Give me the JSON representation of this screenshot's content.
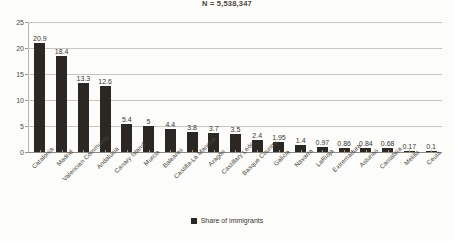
{
  "chart_data": {
    "type": "bar",
    "title": "N = 5,538,347",
    "xlabel": "",
    "ylabel": "",
    "ylim": [
      0,
      25
    ],
    "yticks": [
      0,
      5,
      10,
      15,
      20,
      25
    ],
    "grid": true,
    "legend_position": "bottom",
    "series_name": "Share of immigrants",
    "bar_color": "#2b2722",
    "categories": [
      "Catalonia",
      "Madrid",
      "Valencian Community",
      "Andalucia",
      "Canary Island",
      "Murcia",
      "Baleares",
      "Castilla-La Mancha",
      "Aragón",
      "Castillary León",
      "Basque Country",
      "Galicia",
      "Navarra",
      "LaRioja",
      "Extremadura",
      "Asturias",
      "Cantabria",
      "Melilla",
      "Ceuta"
    ],
    "values": [
      20.9,
      18.4,
      13.3,
      12.6,
      5.4,
      5,
      4.4,
      3.8,
      3.7,
      3.5,
      2.4,
      1.95,
      1.4,
      0.97,
      0.86,
      0.84,
      0.68,
      0.17,
      0.1
    ],
    "value_labels": [
      "20.9",
      "18.4",
      "13.3",
      "12.6",
      "5.4",
      "5",
      "4.4",
      "3.8",
      "3.7",
      "3.5",
      "2.4",
      "1.95",
      "1.4",
      "0.97",
      "0.86",
      "0.84",
      "0.68",
      "0.17",
      "0.1"
    ],
    "ytick_labels": [
      "0",
      "5",
      "10",
      "15",
      "20",
      "25"
    ]
  },
  "legend": {
    "entries": [
      {
        "label": "Share of immigrants",
        "color": "#2b2722"
      }
    ]
  }
}
